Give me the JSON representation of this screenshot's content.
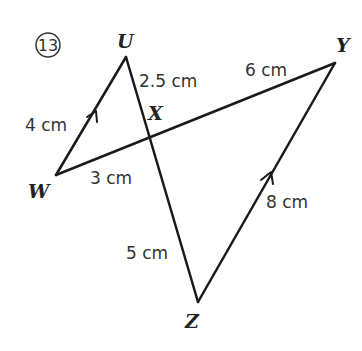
{
  "problem": {
    "number_label": "13",
    "points": {
      "U": {
        "label": "U",
        "x": 126,
        "y": 57
      },
      "W": {
        "label": "W",
        "x": 56,
        "y": 175
      },
      "X": {
        "label": "X",
        "x": 149,
        "y": 115
      },
      "Y": {
        "label": "Y",
        "x": 335,
        "y": 63
      },
      "Z": {
        "label": "Z",
        "x": 198,
        "y": 302
      }
    },
    "measurements": {
      "UW": "4 cm",
      "UX": "2.5 cm",
      "XY": "6 cm",
      "WX": "3 cm",
      "XZ": "5 cm",
      "YZ": "8 cm"
    },
    "parallel_marks": [
      "WU",
      "ZY"
    ],
    "colors": {
      "line": "#1a1a1a",
      "text": "#333333"
    }
  }
}
